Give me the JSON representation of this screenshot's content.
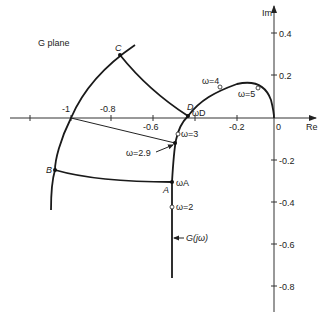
{
  "diagram": {
    "plane_label": "G plane",
    "axes": {
      "real_label": "Re",
      "imag_label": "Im",
      "origin_label": "0",
      "real_ticks": [
        "-1",
        "-0.8",
        "-0.6",
        "-0.2"
      ],
      "imag_ticks": [
        "0.4",
        "0.2",
        "-0.2",
        "-0.4",
        "-0.6",
        "-0.8"
      ]
    },
    "points": {
      "A": "A",
      "B": "B",
      "C": "C",
      "D": "D"
    },
    "frequency_labels": {
      "w_A": "ωA",
      "w_D": "ωD",
      "w2": "ω=2",
      "w29": "ω=2.9",
      "w3": "ω=3",
      "w4": "ω=4",
      "w5": "ω=5"
    },
    "curve_label": "G(jω)"
  }
}
